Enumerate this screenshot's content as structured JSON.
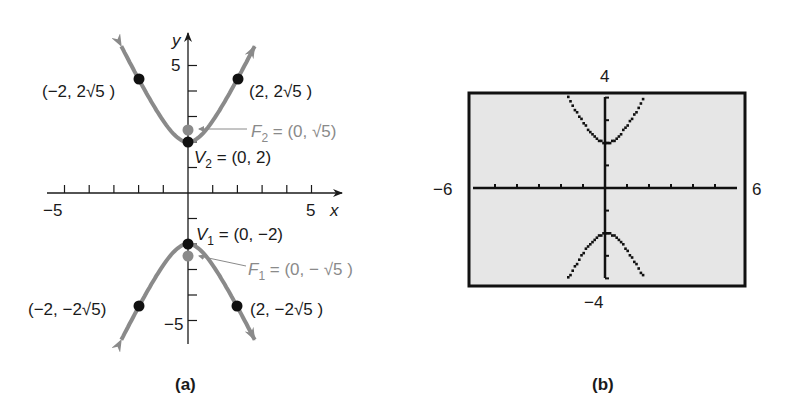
{
  "chart_data": [
    {
      "type": "line",
      "panel": "(a)",
      "title": "",
      "xlabel": "x",
      "ylabel": "y",
      "xlim": [
        -6,
        6
      ],
      "ylim": [
        -6,
        6
      ],
      "x_tick_labels": [
        {
          "value": -5,
          "label": "−5"
        },
        {
          "value": 5,
          "label": "5"
        }
      ],
      "y_tick_labels": [
        {
          "value": 5,
          "label": "5"
        },
        {
          "value": -5,
          "label": "−5"
        }
      ],
      "grid": false,
      "equation": "y^2/4 - x^2 = 1",
      "series": [
        {
          "name": "upper branch",
          "color": "#8a8a8a",
          "function": "y = sqrt(4 + 4x^2)",
          "x_range": [
            -2.7,
            2.7
          ]
        },
        {
          "name": "lower branch",
          "color": "#8a8a8a",
          "function": "y = -sqrt(4 + 4x^2)",
          "x_range": [
            -2.7,
            2.7
          ]
        }
      ],
      "points": [
        {
          "name": "V2",
          "x": 0,
          "y": 2,
          "label": "V",
          "sub": "2",
          "text": " = (0, 2)",
          "color": "#111111"
        },
        {
          "name": "F2",
          "x": 0,
          "y": 2.236,
          "label": "F",
          "sub": "2",
          "text": " = (0, √5)",
          "color": "#8a8a8a"
        },
        {
          "name": "V1",
          "x": 0,
          "y": -2,
          "label": "V",
          "sub": "1",
          "text": " = (0, −2)",
          "color": "#111111"
        },
        {
          "name": "F1",
          "x": 0,
          "y": -2.236,
          "label": "F",
          "sub": "1",
          "text": " = (0, − √5 )",
          "color": "#8a8a8a"
        },
        {
          "name": "P1",
          "x": -2,
          "y": 4.472,
          "text": "(−2, 2√5 )",
          "color": "#111111"
        },
        {
          "name": "P2",
          "x": 2,
          "y": 4.472,
          "text": "(2, 2√5 )",
          "color": "#111111"
        },
        {
          "name": "P3",
          "x": -2,
          "y": -4.472,
          "text": "(−2, −2√5)",
          "color": "#111111"
        },
        {
          "name": "P4",
          "x": 2,
          "y": -4.472,
          "text": "(2, −2√5 )",
          "color": "#111111"
        }
      ],
      "caption": "(a)"
    },
    {
      "type": "line",
      "panel": "(b)",
      "title": "Graphing calculator window",
      "xlim": [
        -6,
        6
      ],
      "ylim": [
        -4,
        4
      ],
      "window_labels": {
        "xmin": "−6",
        "xmax": "6",
        "ymin": "−4",
        "ymax": "4"
      },
      "grid": false,
      "series": [
        {
          "name": "Y1 upper",
          "function": "y = sqrt(4 + 4x^2)",
          "x_range": [
            -1.73,
            1.73
          ]
        },
        {
          "name": "Y2 lower",
          "function": "y = -sqrt(4 + 4x^2)",
          "x_range": [
            -1.73,
            1.73
          ]
        }
      ],
      "caption": "(b)"
    }
  ],
  "panel_a": {
    "x_axis_label": "x",
    "y_axis_label": "y",
    "x_min_label": "−5",
    "x_max_label": "5",
    "y_max_label": "5",
    "y_min_label": "−5",
    "P1": "(−2, 2√5 )",
    "P2": "(2, 2√5 )",
    "P3": "(−2, −2√5)",
    "P4": "(2, −2√5 )",
    "F2_letter": "F",
    "F2_sub": "2",
    "F2_text": " = (0, √5)",
    "V2_letter": "V",
    "V2_sub": "2",
    "V2_text": " = (0, 2)",
    "V1_letter": "V",
    "V1_sub": "1",
    "V1_text": " = (0, −2)",
    "F1_letter": "F",
    "F1_sub": "1",
    "F1_text": " = (0, − √5 )",
    "caption": "(a)"
  },
  "panel_b": {
    "ymax": "4",
    "ymin": "−4",
    "xmin": "−6",
    "xmax": "6",
    "caption": "(b)"
  },
  "colors": {
    "curve": "#8a8a8a",
    "ink": "#1a1a1a",
    "focus": "#8a8a8a",
    "screen": "#e6e6e6"
  }
}
